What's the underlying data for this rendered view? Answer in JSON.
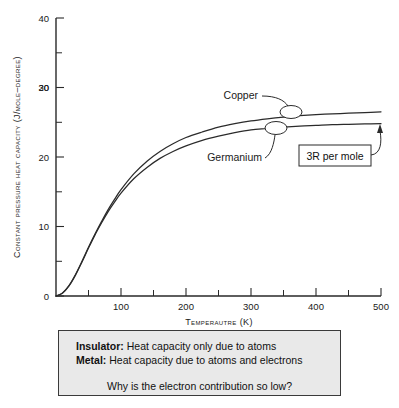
{
  "chart_data": {
    "type": "line",
    "title": "",
    "xlabel": "Temperautre (K)",
    "ylabel": "Constant pressure heat capacity (J/mole–degree)",
    "xlim": [
      0,
      500
    ],
    "ylim": [
      0,
      40
    ],
    "xticks": [
      0,
      100,
      200,
      300,
      400,
      500
    ],
    "xtick_labels": [
      "",
      "100",
      "200",
      "300",
      "400",
      "500"
    ],
    "xticks_minor": [
      50,
      150,
      250,
      350,
      450
    ],
    "yticks": [
      0,
      10,
      20,
      30,
      40
    ],
    "ytick_labels": [
      "0",
      "10",
      "20",
      "30",
      "40"
    ],
    "yticks_minor": [
      5,
      15,
      25,
      35
    ],
    "grid": false,
    "legend": "inline-labels",
    "series": [
      {
        "name": "Copper",
        "label_text": "Copper",
        "x": [
          0,
          10,
          20,
          30,
          40,
          50,
          60,
          70,
          80,
          90,
          100,
          120,
          140,
          160,
          180,
          200,
          225,
          250,
          275,
          300,
          325,
          350,
          375,
          400,
          425,
          450,
          475,
          500
        ],
        "values": [
          0,
          0.45,
          1.5,
          3.1,
          5.0,
          7.0,
          8.9,
          10.7,
          12.4,
          13.9,
          15.3,
          17.6,
          19.4,
          20.8,
          21.9,
          22.8,
          23.6,
          24.3,
          24.8,
          25.2,
          25.5,
          25.75,
          25.95,
          26.1,
          26.2,
          26.3,
          26.4,
          26.5
        ]
      },
      {
        "name": "Germanium",
        "label_text": "Germanium",
        "x": [
          0,
          10,
          20,
          30,
          40,
          50,
          60,
          70,
          80,
          90,
          100,
          120,
          140,
          160,
          180,
          200,
          225,
          250,
          275,
          300,
          325,
          350,
          375,
          400,
          425,
          450,
          475,
          500
        ],
        "values": [
          0,
          0.4,
          1.45,
          3.0,
          4.9,
          6.9,
          8.8,
          10.5,
          12.1,
          13.5,
          14.8,
          16.9,
          18.5,
          19.8,
          20.8,
          21.6,
          22.4,
          23.0,
          23.5,
          23.9,
          24.1,
          24.3,
          24.45,
          24.55,
          24.65,
          24.7,
          24.75,
          24.8
        ]
      }
    ],
    "annotations": [
      {
        "text": "Copper",
        "marker_x": 382,
        "marker_y": 26.1
      },
      {
        "text": "Germanium",
        "marker_x": 350,
        "marker_y": 24.3
      },
      {
        "text": "3R per mole",
        "boxed": true,
        "points_to": "germanium-plateau"
      }
    ]
  },
  "annotations": {
    "copper_label": "Copper",
    "germanium_label": "Germanium",
    "three_r_label": "3R per mole"
  },
  "caption": {
    "line1_bold": "Insulator:",
    "line1_rest": " Heat capacity only due to atoms",
    "line2_bold": "Metal:",
    "line2_rest": " Heat capacity due to atoms and electrons",
    "question": "Why is the electron contribution so low?"
  },
  "colors": {
    "curve": "#2b2b2b",
    "axis": "#2a2a2a",
    "caption_bg": "#e9e9e9",
    "caption_border": "#3a3a3a"
  }
}
